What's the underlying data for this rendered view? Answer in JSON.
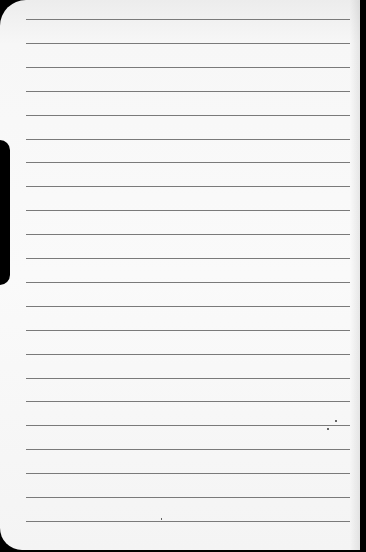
{
  "image": {
    "description": "Blank ruled notebook page photographed against black background",
    "paper_color": "#f8f8f8",
    "line_color": "#7a7a7a",
    "line_count": 22,
    "line_start_y": 19,
    "line_spacing": 23.9,
    "text": ""
  }
}
